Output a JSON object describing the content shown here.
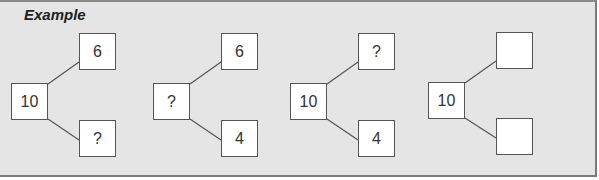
{
  "title": "Example",
  "groups": [
    {
      "whole": "10",
      "part_top": "6",
      "part_bottom": "?"
    },
    {
      "whole": "?",
      "part_top": "6",
      "part_bottom": "4"
    },
    {
      "whole": "10",
      "part_top": "?",
      "part_bottom": "4"
    },
    {
      "whole": "10",
      "part_top": "",
      "part_bottom": ""
    }
  ]
}
